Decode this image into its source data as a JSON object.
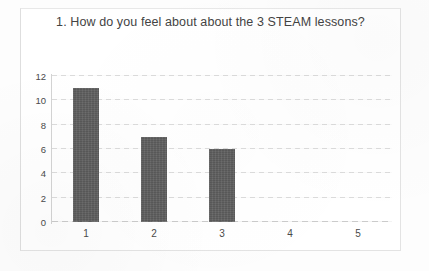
{
  "chart_data": {
    "type": "bar",
    "title": "1. How do you feel about about the 3 STEAM lessons?",
    "categories": [
      "1",
      "2",
      "3",
      "4",
      "5"
    ],
    "values": [
      11,
      7,
      6,
      0,
      0
    ],
    "series": [
      {
        "name": "Responses",
        "values": [
          11,
          7,
          6,
          0,
          0
        ]
      }
    ],
    "xlabel": "",
    "ylabel": "",
    "ylim": [
      0,
      12
    ],
    "y_ticks": [
      "0",
      "2",
      "4",
      "6",
      "8",
      "10",
      "12"
    ],
    "y_tick_values": [
      0,
      2,
      4,
      6,
      8,
      10,
      12
    ],
    "grid": true,
    "legend": false,
    "legend_position": "none",
    "bar_color": "#5e5e5e",
    "background_color": "#ffffff",
    "text_color": "#434343",
    "gridline_color": "#c9c9c9"
  }
}
